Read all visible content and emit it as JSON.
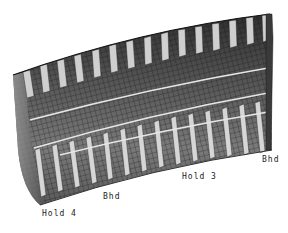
{
  "figure": {
    "colors": {
      "background": "#ffffff",
      "shell_dark": "#2a2a2a",
      "shell_mid": "#6a6a6a",
      "shell_light": "#a8a8a8",
      "frame_highlight": "#d8d8d8",
      "mesh_line": "#111111"
    },
    "frame_count": 15,
    "stringer_count": 3
  },
  "labels": {
    "hold4": "Hold 4",
    "bhd_left": "Bhd",
    "hold3": "Hold 3",
    "bhd_right": "Bhd"
  }
}
